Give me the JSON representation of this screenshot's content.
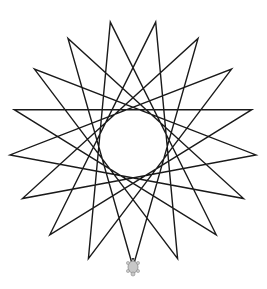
{
  "canvas": {
    "width": 267,
    "height": 289,
    "background": "#ffffff"
  },
  "drawing": {
    "type": "star-polygon",
    "points": 17,
    "step": 7,
    "center": [
      133,
      143.5
    ],
    "radius": 123.5,
    "start_angle_deg": 90,
    "stroke_color": "#1a1a1a",
    "stroke_width": 1.4
  },
  "turtle": {
    "icon": "turtle-icon",
    "position": [
      133,
      267
    ],
    "color": "#b0b0b0"
  }
}
